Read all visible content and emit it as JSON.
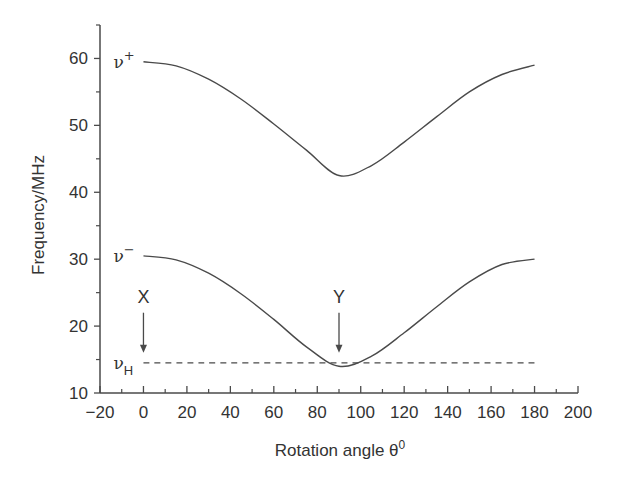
{
  "chart_data": {
    "type": "line",
    "title": "",
    "xlabel": "Rotation angle θ⁰",
    "xlabel_main": "Rotation angle θ",
    "xlabel_sup": "0",
    "ylabel": "Frequency/MHz",
    "xlim": [
      -20,
      200
    ],
    "ylim": [
      10,
      65
    ],
    "xticks": [
      -20,
      0,
      20,
      40,
      60,
      80,
      100,
      120,
      140,
      160,
      180,
      200
    ],
    "xtick_labels": [
      "−20",
      "0",
      "20",
      "40",
      "60",
      "80",
      "100",
      "120",
      "140",
      "160",
      "180",
      "200"
    ],
    "yticks": [
      10,
      20,
      30,
      40,
      50,
      60
    ],
    "ytick_labels": [
      "10",
      "20",
      "30",
      "40",
      "50",
      "60"
    ],
    "grid": false,
    "legend": "none (inline curve labels)",
    "series": [
      {
        "name": "ν+",
        "label_main": "ν",
        "label_sup": "+",
        "style": "solid",
        "x": [
          0,
          15,
          30,
          45,
          60,
          75,
          90,
          105,
          120,
          135,
          150,
          165,
          180
        ],
        "y": [
          59.5,
          58.9,
          56.9,
          53.9,
          50.2,
          46.3,
          42.5,
          44.0,
          47.5,
          51.3,
          55.0,
          57.6,
          59.0
        ]
      },
      {
        "name": "ν−",
        "label_main": "ν",
        "label_sup": "−",
        "style": "solid",
        "x": [
          0,
          15,
          30,
          45,
          60,
          75,
          90,
          105,
          120,
          135,
          150,
          165,
          180
        ],
        "y": [
          30.5,
          29.9,
          27.9,
          24.8,
          21.0,
          16.9,
          14.0,
          15.5,
          19.0,
          22.9,
          26.6,
          29.2,
          30.0
        ]
      },
      {
        "name": "νH",
        "label_main": "ν",
        "label_sub": "H",
        "style": "dashed",
        "x": [
          0,
          180
        ],
        "y": [
          14.5,
          14.5
        ]
      }
    ],
    "annotations": [
      {
        "text": "X",
        "x": 0,
        "arrow_from_y": 22,
        "arrow_to_y": 16
      },
      {
        "text": "Y",
        "x": 90,
        "arrow_from_y": 22,
        "arrow_to_y": 16
      }
    ]
  }
}
